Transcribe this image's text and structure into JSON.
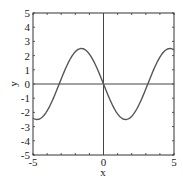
{
  "chart_data": {
    "type": "line",
    "title": "",
    "xlabel": "x",
    "ylabel": "y",
    "xlim": [
      -5,
      5
    ],
    "ylim": [
      -5,
      5
    ],
    "grid": false,
    "legend": null,
    "xticks": [
      -5,
      0,
      5
    ],
    "xtick_labels": [
      "-5",
      "0",
      "5"
    ],
    "yticks": [
      -5,
      -4,
      -3,
      -2,
      -1,
      0,
      1,
      2,
      3,
      4,
      5
    ],
    "ytick_labels": [
      "-5",
      "-4",
      "-3",
      "-2",
      "-1",
      "0",
      "1",
      "2",
      "3",
      "4",
      "5"
    ],
    "minor_ticks_every": 1,
    "zero_lines": {
      "x": 0,
      "y": 0
    },
    "series": [
      {
        "name": "y = -2.5 sin(x)",
        "function": "-2.5*sin(x)",
        "color": "#555555",
        "x": [
          -5,
          -4.5,
          -4,
          -3.5,
          -3,
          -2.5,
          -2,
          -1.5708,
          -1,
          -0.5,
          0,
          0.5,
          1,
          1.5708,
          2,
          2.5,
          3,
          3.5,
          4,
          4.5,
          5
        ],
        "y": [
          -2.4,
          -2.44,
          -1.89,
          -0.88,
          0.35,
          1.5,
          2.27,
          2.5,
          2.1,
          1.2,
          0.0,
          -1.2,
          -2.1,
          -2.5,
          -2.27,
          -1.5,
          -0.35,
          0.88,
          1.89,
          2.44,
          2.4
        ]
      }
    ]
  },
  "colors": {
    "axis": "#333333",
    "curve": "#555555",
    "zero_line": "#444444"
  }
}
